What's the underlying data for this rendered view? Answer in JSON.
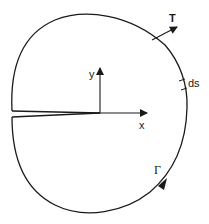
{
  "diagram": {
    "colors": {
      "stroke": "#1a1a1a",
      "background": "#ffffff"
    },
    "labels": {
      "traction": "T",
      "arc_element": "ds",
      "y_axis": "y",
      "x_axis": "x",
      "contour": "Γ"
    }
  }
}
